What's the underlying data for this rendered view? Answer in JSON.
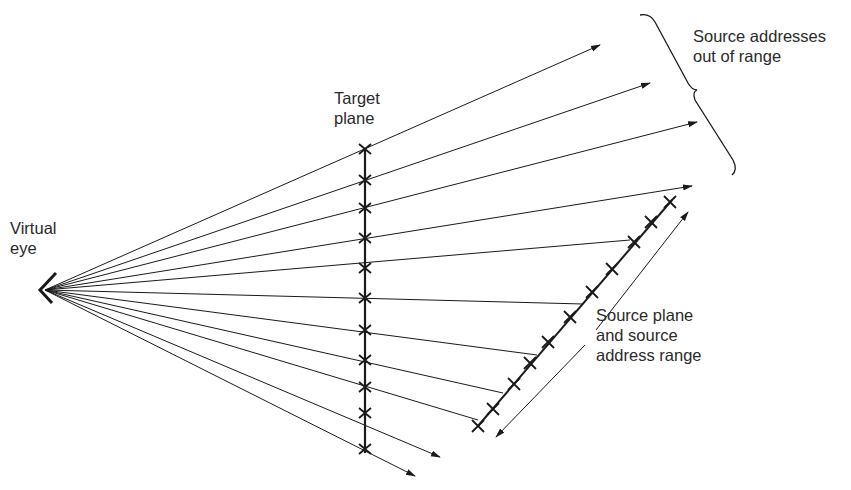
{
  "labels": {
    "virtual_eye": "Virtual\neye",
    "target_plane": "Target\nplane",
    "out_of_range": "Source addresses\nout of range",
    "source_plane": "Source plane\nand source\naddress range"
  },
  "colors": {
    "ink": "#1a1a1a",
    "background": "#ffffff"
  },
  "geometry": {
    "eye": [
      45,
      290
    ],
    "target_plane": {
      "x": 365,
      "y_top": 148,
      "y_bottom": 452,
      "marks": 11
    },
    "source_plane": {
      "start": [
        478,
        428
      ],
      "end": [
        672,
        200
      ],
      "marks": 11
    },
    "rays_out_of_range": [
      [
        600,
        45
      ],
      [
        650,
        83
      ],
      [
        697,
        122
      ],
      [
        692,
        186
      ]
    ],
    "rays_hit_source": [
      [
        655,
        205
      ],
      [
        618,
        245
      ],
      [
        580,
        290
      ],
      [
        548,
        338
      ],
      [
        510,
        380
      ],
      [
        470,
        420
      ]
    ],
    "rays_below": [
      [
        440,
        457
      ],
      [
        415,
        476
      ]
    ]
  }
}
